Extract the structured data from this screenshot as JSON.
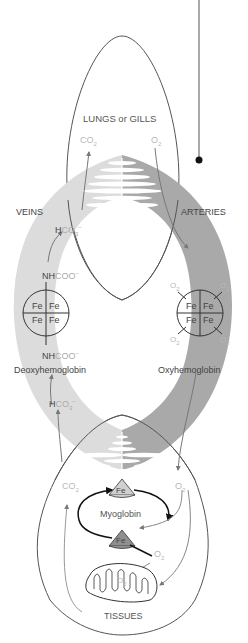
{
  "diagram": {
    "regions": {
      "top": "LUNGS or GILLS",
      "bottom": "TISSUES",
      "left": "VEINS",
      "right": "ARTERIES"
    },
    "molecules": {
      "co2": "CO",
      "o2": "O",
      "sub2": "2",
      "hco3_h": "H",
      "hco3_rest": "CO",
      "sub3": "3",
      "minus": "−",
      "nh": "NH",
      "coo": "COO",
      "fe": "Fe"
    },
    "proteins": {
      "deoxy": "Deoxyhemoglobin",
      "oxy": "Oxyhemoglobin",
      "myo": "Myoglobin"
    },
    "colors": {
      "vein_band": "#dcdcdc",
      "artery_band": "#a9a9a9",
      "outline": "#555555",
      "faint_text": "#b8b8b8",
      "myo_top_fill": "#d0d0d0",
      "myo_bottom_fill": "#8f8f8f"
    }
  }
}
